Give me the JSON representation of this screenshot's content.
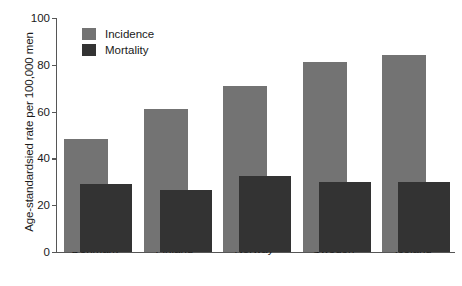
{
  "chart_data": {
    "type": "bar",
    "title": "",
    "subtitle": "",
    "xlabel": "",
    "ylabel": "Age-standardsied rate per 100,000 men",
    "ylim": [
      0,
      100
    ],
    "yticks": [
      0,
      20,
      40,
      60,
      80,
      100
    ],
    "ytick_labels": [
      "0",
      "20",
      "40",
      "60",
      "80",
      "100"
    ],
    "grid": false,
    "legend_position": "top-left",
    "categories": [
      "Denmark",
      "Finland",
      "Norway",
      "Sweden",
      "Iceland"
    ],
    "series": [
      {
        "name": "Incidence",
        "color": "#737373",
        "values": [
          48.5,
          61,
          71,
          81,
          84
        ]
      },
      {
        "name": "Mortality",
        "color": "#333333",
        "values": [
          29,
          26.5,
          32.5,
          30,
          30
        ]
      }
    ]
  },
  "axis": {
    "line_color": "#565656"
  }
}
